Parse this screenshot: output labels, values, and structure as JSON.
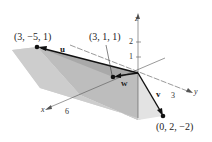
{
  "diagram": {
    "type": "3d-parallelepiped-vectors",
    "axes": {
      "x": "x",
      "y": "y",
      "z": "z"
    },
    "ticks": {
      "z": [
        "1",
        "2"
      ],
      "y": [
        "3"
      ],
      "x": [
        "6"
      ]
    },
    "points": [
      {
        "label": "(3, −5, 1)",
        "vector": "u"
      },
      {
        "label": "(3, 1, 1)",
        "vector": "w"
      },
      {
        "label": "(0, 2, −2)",
        "vector": "v"
      }
    ],
    "vectors": {
      "u": "u",
      "v": "v",
      "w": "w"
    },
    "colors": {
      "face_light": "#d9d9d9",
      "face_mid": "#c4c4c4",
      "face_dark": "#aeaeae",
      "vector": "#111111"
    }
  }
}
